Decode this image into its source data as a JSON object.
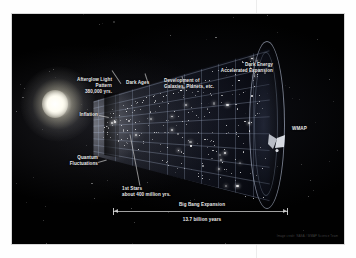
{
  "poster": {
    "title": "Timeline of the Universe",
    "credit": "Image credit: NASA / WMAP Science Team"
  },
  "labels": {
    "afterglow": "Afterglow Light\nPattern\n380,000 yrs.",
    "dark_ages": "Dark Ages",
    "development": "Development of\nGalaxies, Planets, etc.",
    "dark_energy": "Dark Energy\nAccelerated Expansion",
    "inflation": "Inflation",
    "quantum": "Quantum\nFluctuations",
    "first_stars": "1st Stars\nabout 400 million yrs.",
    "wmap": "WMAP",
    "big_bang_expansion": "Big Bang Expansion",
    "duration": "13.7 billion years"
  },
  "chart_data": {
    "type": "diagram",
    "xlabel": "Big Bang Expansion",
    "axis_span_label": "13.7 billion years",
    "epochs": [
      {
        "name": "Quantum Fluctuations",
        "time": "0 yrs.",
        "position_pct": 2
      },
      {
        "name": "Inflation",
        "time": "10^-32 s",
        "position_pct": 6
      },
      {
        "name": "Afterglow Light Pattern",
        "time": "380,000 yrs.",
        "position_pct": 14
      },
      {
        "name": "Dark Ages",
        "time": "380,000 - 400 million yrs.",
        "position_pct": 24
      },
      {
        "name": "1st Stars",
        "time": "about 400 million yrs.",
        "position_pct": 33
      },
      {
        "name": "Development of Galaxies, Planets, etc.",
        "time": "1 - 9 billion yrs.",
        "position_pct": 58
      },
      {
        "name": "Dark Energy Accelerated Expansion",
        "time": "9 - 13.7 billion yrs.",
        "position_pct": 88
      }
    ],
    "observer": {
      "name": "WMAP",
      "position_pct": 100
    },
    "total_age_billion_years": 13.7,
    "grid": true,
    "legend": "none"
  },
  "colors": {
    "background": "#ffffff",
    "poster_background": "#000000",
    "label_text": "#e9e9e9",
    "grid_line": "#aab4c8",
    "flash": "#ffffff",
    "frame_border": "#d8d8d8"
  }
}
